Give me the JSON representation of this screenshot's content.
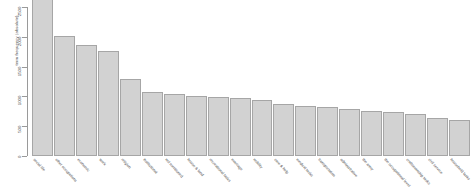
{
  "chart_data": {
    "type": "bar",
    "title": "",
    "xlabel": "",
    "ylabel": "term frequency (absolute)",
    "ylim": [
      0,
      2500
    ],
    "grid": false,
    "legend": null,
    "orientation": "vertical",
    "bar_color": "#d2d2d2",
    "bar_border_color": "#a6a6a6",
    "yticks": [
      0,
      500,
      1000,
      1500,
      2000,
      2500
    ],
    "ytick_labels": [
      "0",
      "500",
      "1000",
      "1500",
      "2000",
      "2500"
    ],
    "categories": [
      "social life",
      "other occupations",
      "economic",
      "work",
      "religion",
      "institutional",
      "not mentioned",
      "house & land",
      "recreational tasks",
      "marriage",
      "nobility",
      "care & help",
      "medical tasks",
      "transportation",
      "administrative",
      "the army",
      "the occupational level",
      "craftsmanship tasks",
      "civil service",
      "household tasks"
    ],
    "values": [
      2600,
      1920,
      1780,
      1690,
      1230,
      1020,
      1000,
      960,
      940,
      930,
      900,
      840,
      800,
      780,
      760,
      720,
      700,
      680,
      610,
      580
    ]
  }
}
